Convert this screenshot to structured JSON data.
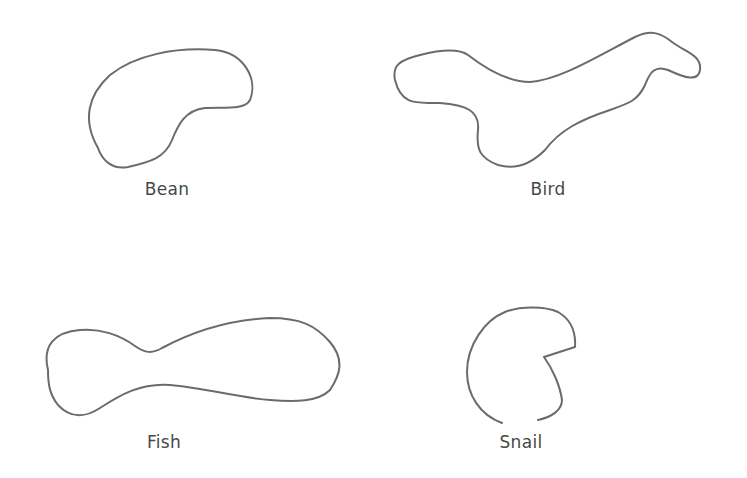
{
  "figure": {
    "background": "#ffffff",
    "stroke_color": "#6b6b6b",
    "label_color": "#474747",
    "shapes": [
      {
        "id": "bean",
        "label": "Bean",
        "label_pos": {
          "x": 167,
          "y": 179
        },
        "path": "M 98 148 C 82 120, 88 95, 110 75 C 135 55, 175 47, 215 50 C 245 53, 258 80, 250 100 C 245 110, 225 107, 205 108 C 185 110, 178 125, 172 140 C 165 158, 150 162, 128 167 C 112 170, 102 160, 98 148 Z"
      },
      {
        "id": "bird",
        "label": "Bird",
        "label_pos": {
          "x": 548,
          "y": 179
        },
        "path": "M 395 80 C 392 65, 400 60, 420 55 C 440 50, 458 48, 468 55 C 490 72, 510 82, 530 82 C 560 80, 600 55, 635 37 C 650 30, 660 32, 672 42 C 685 52, 702 55, 700 70 C 698 82, 685 78, 668 70 C 655 65, 650 72, 645 85 C 638 100, 630 103, 610 110 C 580 120, 560 130, 545 150 C 530 165, 515 170, 498 165 C 480 158, 476 150, 478 130 C 480 110, 465 105, 440 103 C 420 102, 402 108, 395 80 Z"
      },
      {
        "id": "fish",
        "label": "Fish",
        "label_pos": {
          "x": 164,
          "y": 432
        },
        "path": "M 48 370 C 42 345, 55 332, 80 330 C 100 328, 120 335, 135 346 C 145 353, 152 354, 162 348 C 190 333, 225 320, 270 318 C 300 318, 315 325, 330 342 C 345 360, 340 375, 330 390 C 318 402, 295 402, 270 400 C 240 398, 205 388, 170 385 C 140 383, 120 395, 100 408 C 85 418, 70 418, 58 405 C 50 395, 48 385, 48 370 Z"
      },
      {
        "id": "snail",
        "label": "Snail",
        "label_pos": {
          "x": 521,
          "y": 432
        },
        "path": "M 502 423 C 480 415, 467 395, 467 372 C 467 345, 485 320, 505 312 C 520 306, 545 306, 558 312 C 572 320, 576 332, 575 347 L 544 357 C 552 368, 560 385, 562 400 C 562 410, 552 417, 538 420"
      }
    ]
  }
}
